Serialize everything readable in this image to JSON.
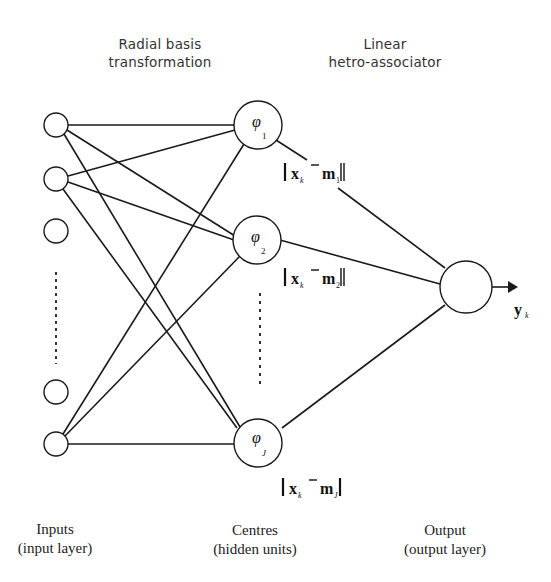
{
  "headers": {
    "left": [
      "Radial basis",
      "transformation"
    ],
    "right": [
      "Linear",
      "hetro-associator"
    ]
  },
  "nodes": {
    "hidden": [
      {
        "symbol": "φ",
        "subscript": "1",
        "norm_label": {
          "x": "x",
          "x_sub": "k",
          "m": "m",
          "m_sub": "1"
        }
      },
      {
        "symbol": "φ",
        "subscript": "2",
        "norm_label": {
          "x": "x",
          "x_sub": "k",
          "m": "m",
          "m_sub": "2"
        }
      },
      {
        "symbol": "φ",
        "subscript": "J",
        "norm_label": {
          "x": "x",
          "x_sub": "k",
          "m": "m",
          "m_sub": "J"
        }
      }
    ],
    "output": {
      "label": "y",
      "subscript": "k"
    }
  },
  "footer": {
    "inputs": [
      "Inputs",
      "(input layer)"
    ],
    "centres": [
      "Centres",
      "(hidden units)"
    ],
    "output": [
      "Output",
      "(output layer)"
    ]
  },
  "colors": {
    "stroke": "#1a1a1a",
    "background": "#ffffff"
  }
}
